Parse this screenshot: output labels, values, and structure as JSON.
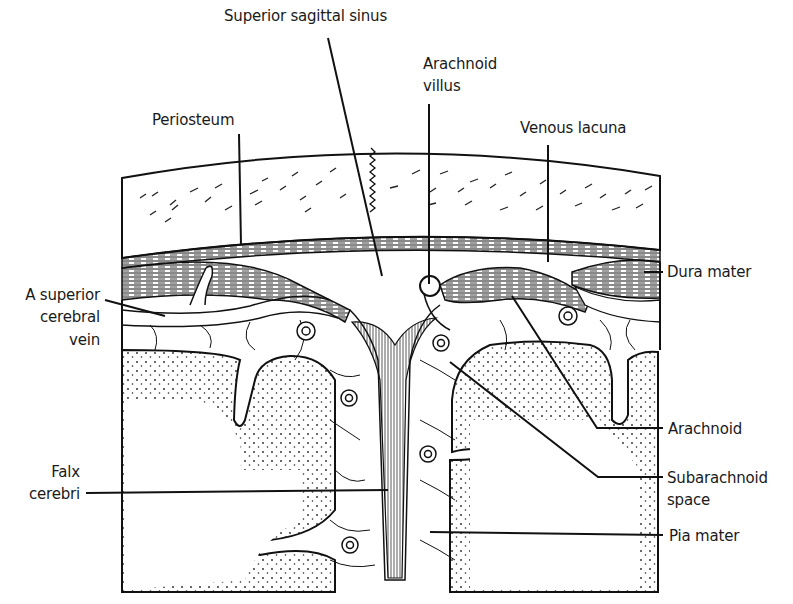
{
  "diagram": {
    "labels": {
      "superior_sagittal_sinus": "Superior sagittal sinus",
      "arachnoid_villus_1": "Arachnoid",
      "arachnoid_villus_2": "villus",
      "periosteum": "Periosteum",
      "venous_lacuna": "Venous lacuna",
      "dura_mater": "Dura mater",
      "superior_cerebral_vein_1": "A superior",
      "superior_cerebral_vein_2": "cerebral",
      "superior_cerebral_vein_3": "vein",
      "arachnoid": "Arachnoid",
      "subarachnoid_space_1": "Subarachnoid",
      "subarachnoid_space_2": "space",
      "falx_cerebri_1": "Falx",
      "falx_cerebri_2": "cerebri",
      "pia_mater": "Pia mater"
    },
    "colors": {
      "ink": "#111111",
      "paper": "#ffffff"
    }
  }
}
